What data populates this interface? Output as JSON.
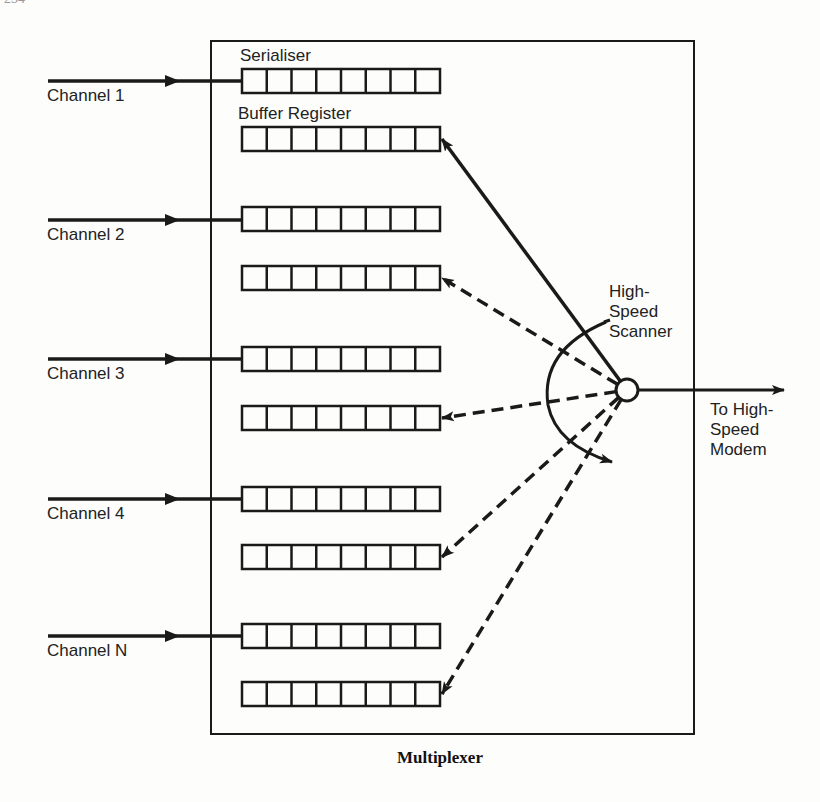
{
  "page_number": "234",
  "caption": "Multiplexer",
  "labels": {
    "serialiser": "Serialiser",
    "buffer_register": "Buffer Register",
    "scanner": [
      "High-",
      "Speed",
      "Scanner"
    ],
    "output": [
      "To High-",
      "Speed",
      "Modem"
    ]
  },
  "channels": [
    {
      "name": "Channel 1",
      "line_y": 81,
      "serialiser_y": 69,
      "buffer_y": 127
    },
    {
      "name": "Channel 2",
      "line_y": 220,
      "serialiser_y": 207,
      "buffer_y": 266
    },
    {
      "name": "Channel 3",
      "line_y": 359,
      "serialiser_y": 347,
      "buffer_y": 406
    },
    {
      "name": "Channel 4",
      "line_y": 499,
      "serialiser_y": 487,
      "buffer_y": 545
    },
    {
      "name": "Channel N",
      "line_y": 636,
      "serialiser_y": 624,
      "buffer_y": 682
    }
  ],
  "register_cells": 8,
  "active_buffer_index": 0,
  "colors": {
    "ink": "#1a1a1a",
    "paper": "#fdfdfb"
  }
}
